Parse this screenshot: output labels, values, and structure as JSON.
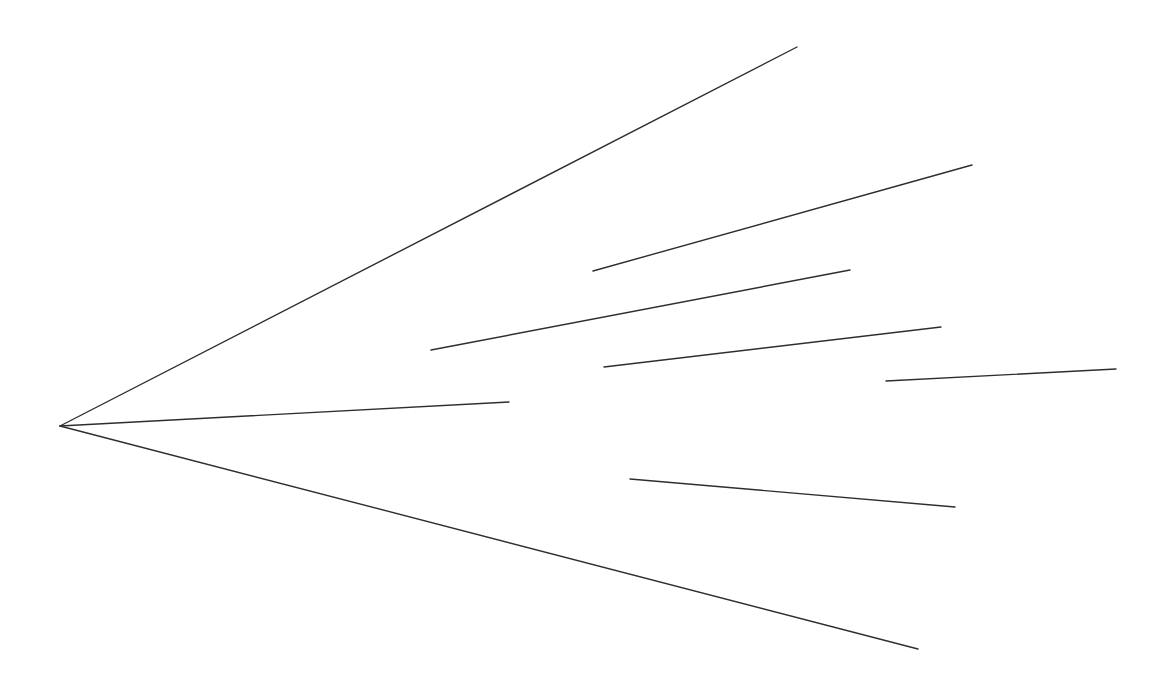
{
  "canvas": {
    "width": 1152,
    "height": 678,
    "background": "#ffffff",
    "stroke_color": "#2e2e2e"
  },
  "apex": {
    "x": 60,
    "y": 426
  },
  "rays": [
    {
      "name": "ray-upper",
      "x1": 60,
      "y1": 426,
      "x2": 797,
      "y2": 47
    },
    {
      "name": "ray-middle",
      "x1": 60,
      "y1": 426,
      "x2": 509,
      "y2": 402
    },
    {
      "name": "ray-lower",
      "x1": 60,
      "y1": 426,
      "x2": 918,
      "y2": 649
    }
  ],
  "segments": [
    {
      "name": "segment-1",
      "x1": 593,
      "y1": 271,
      "x2": 972,
      "y2": 165
    },
    {
      "name": "segment-2",
      "x1": 431,
      "y1": 350,
      "x2": 850,
      "y2": 270
    },
    {
      "name": "segment-3",
      "x1": 604,
      "y1": 367,
      "x2": 941,
      "y2": 327
    },
    {
      "name": "segment-4",
      "x1": 886,
      "y1": 381,
      "x2": 1116,
      "y2": 369
    },
    {
      "name": "segment-5",
      "x1": 630,
      "y1": 479,
      "x2": 955,
      "y2": 507
    }
  ]
}
